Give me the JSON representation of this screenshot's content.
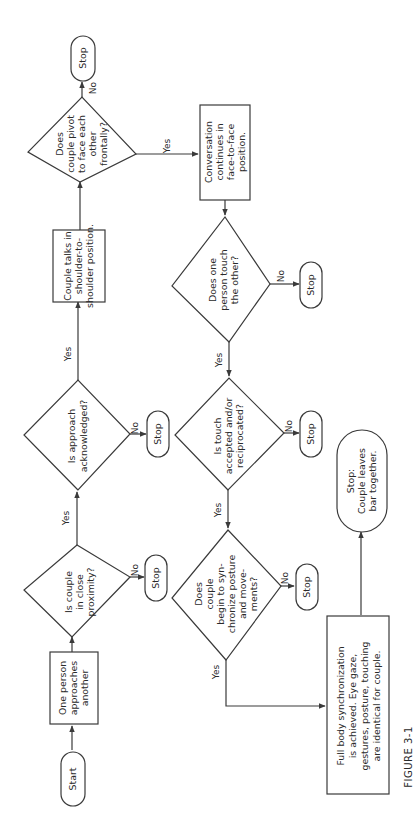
{
  "figure_caption": "FIGURE 3-1",
  "orientation": "rotated 90 degrees counter-clockwise",
  "colors": {
    "line": "#3a3a3a",
    "text": "#2a2a2a",
    "background": "#ffffff"
  },
  "edge_labels": {
    "yes": "Yes",
    "no": "No"
  },
  "nodes": {
    "start": {
      "type": "terminal",
      "lines": [
        "Start"
      ]
    },
    "approach": {
      "type": "process",
      "lines": [
        "One person",
        "approaches",
        "another"
      ]
    },
    "proximity": {
      "type": "decision",
      "lines": [
        "Is couple",
        "in close",
        "proximity?"
      ]
    },
    "stop1": {
      "type": "terminal",
      "lines": [
        "Stop"
      ]
    },
    "acknowledged": {
      "type": "decision",
      "lines": [
        "Is approach",
        "acknowledged?"
      ]
    },
    "stop2": {
      "type": "terminal",
      "lines": [
        "Stop"
      ]
    },
    "shoulder": {
      "type": "process",
      "lines": [
        "Couple talks in",
        "shoulder-to-",
        "shoulder position."
      ]
    },
    "pivot": {
      "type": "decision",
      "lines": [
        "Does",
        "couple pivot",
        "to face each",
        "other",
        "frontally?"
      ]
    },
    "stop3": {
      "type": "terminal",
      "lines": [
        "Stop"
      ]
    },
    "face": {
      "type": "process",
      "lines": [
        "Conversation",
        "continues in",
        "face-to-face",
        "position."
      ]
    },
    "touch": {
      "type": "decision",
      "lines": [
        "Does one",
        "person touch",
        "the other?"
      ]
    },
    "stop4": {
      "type": "terminal",
      "lines": [
        "Stop"
      ]
    },
    "reciprocated": {
      "type": "decision",
      "lines": [
        "Is touch",
        "accepted and/or",
        "reciprocated?"
      ]
    },
    "stop5": {
      "type": "terminal",
      "lines": [
        "Stop"
      ]
    },
    "synchronize": {
      "type": "decision",
      "lines": [
        "Does",
        "couple",
        "begin to syn-",
        "chronize posture",
        "and move-",
        "ments?"
      ]
    },
    "stop6": {
      "type": "terminal",
      "lines": [
        "Stop"
      ]
    },
    "full_sync": {
      "type": "process",
      "lines": [
        "Full body synchronization",
        "is achieved. Eye gaze,",
        "gestures, posture, touching",
        "are identical for couple."
      ]
    },
    "final": {
      "type": "terminal",
      "lines": [
        "Stop:",
        "Couple leaves",
        "bar together."
      ]
    }
  },
  "edges": [
    {
      "from": "start",
      "to": "approach",
      "label": ""
    },
    {
      "from": "approach",
      "to": "proximity",
      "label": ""
    },
    {
      "from": "proximity",
      "to": "acknowledged",
      "label": "Yes"
    },
    {
      "from": "proximity",
      "to": "stop1",
      "label": "No"
    },
    {
      "from": "acknowledged",
      "to": "shoulder",
      "label": "Yes"
    },
    {
      "from": "acknowledged",
      "to": "stop2",
      "label": "No"
    },
    {
      "from": "shoulder",
      "to": "pivot",
      "label": ""
    },
    {
      "from": "pivot",
      "to": "stop3",
      "label": "No"
    },
    {
      "from": "pivot",
      "to": "face",
      "label": "Yes"
    },
    {
      "from": "face",
      "to": "touch",
      "label": ""
    },
    {
      "from": "touch",
      "to": "stop4",
      "label": "No"
    },
    {
      "from": "touch",
      "to": "reciprocated",
      "label": "Yes"
    },
    {
      "from": "reciprocated",
      "to": "stop5",
      "label": "No"
    },
    {
      "from": "reciprocated",
      "to": "synchronize",
      "label": "Yes"
    },
    {
      "from": "synchronize",
      "to": "stop6",
      "label": "No"
    },
    {
      "from": "synchronize",
      "to": "full_sync",
      "label": "Yes"
    },
    {
      "from": "full_sync",
      "to": "final",
      "label": ""
    }
  ]
}
